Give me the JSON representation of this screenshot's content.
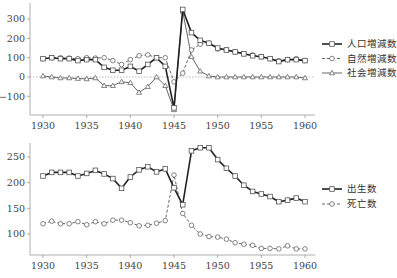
{
  "chart_data": [
    {
      "type": "line",
      "title": "",
      "xlabel": "",
      "ylabel": "",
      "x": [
        1930,
        1931,
        1932,
        1933,
        1934,
        1935,
        1936,
        1937,
        1938,
        1939,
        1940,
        1941,
        1942,
        1943,
        1944,
        1945,
        1946,
        1947,
        1948,
        1949,
        1950,
        1951,
        1952,
        1953,
        1954,
        1955,
        1956,
        1957,
        1958,
        1959,
        1960
      ],
      "xticks": [
        1930,
        1935,
        1940,
        1945,
        1950,
        1955,
        1960
      ],
      "yticks": [
        -100,
        0,
        100,
        200,
        300
      ],
      "ylim": [
        -200,
        400
      ],
      "zero_line": true,
      "grid": false,
      "legend_position": "right",
      "series": [
        {
          "name": "人口増減数",
          "style": "solid-thick",
          "marker": "square",
          "values": [
            95,
            100,
            95,
            95,
            85,
            90,
            90,
            50,
            35,
            35,
            55,
            30,
            65,
            100,
            55,
            -160,
            350,
            230,
            190,
            175,
            150,
            140,
            130,
            120,
            110,
            105,
            95,
            80,
            90,
            90,
            85
          ]
        },
        {
          "name": "自然増減数",
          "style": "dashed",
          "marker": "circle",
          "values": [
            95,
            100,
            100,
            98,
            95,
            100,
            98,
            100,
            85,
            65,
            90,
            110,
            115,
            100,
            100,
            -25,
            20,
            140,
            170,
            175,
            145,
            140,
            130,
            120,
            115,
            105,
            95,
            85,
            90,
            95,
            85
          ]
        },
        {
          "name": "社会増減数",
          "style": "solid-thin",
          "marker": "triangle",
          "values": [
            5,
            0,
            -5,
            -5,
            -8,
            -10,
            -5,
            -45,
            -45,
            -25,
            -30,
            -80,
            -50,
            0,
            -45,
            -170,
            340,
            105,
            30,
            5,
            0,
            0,
            0,
            0,
            0,
            0,
            0,
            0,
            0,
            0,
            -5
          ]
        }
      ]
    },
    {
      "type": "line",
      "title": "",
      "xlabel": "",
      "ylabel": "",
      "x": [
        1930,
        1931,
        1932,
        1933,
        1934,
        1935,
        1936,
        1937,
        1938,
        1939,
        1940,
        1941,
        1942,
        1943,
        1944,
        1945,
        1946,
        1947,
        1948,
        1949,
        1950,
        1951,
        1952,
        1953,
        1954,
        1955,
        1956,
        1957,
        1958,
        1959,
        1960
      ],
      "xticks": [
        1930,
        1935,
        1940,
        1945,
        1950,
        1955,
        1960
      ],
      "yticks": [
        100,
        150,
        200,
        250
      ],
      "ylim": [
        60,
        280
      ],
      "grid": false,
      "legend_position": "right",
      "series": [
        {
          "name": "出生数",
          "style": "solid-thick",
          "marker": "square",
          "values": [
            213,
            220,
            220,
            220,
            213,
            218,
            224,
            217,
            208,
            189,
            211,
            225,
            231,
            221,
            227,
            190,
            157,
            262,
            268,
            268,
            245,
            228,
            213,
            195,
            183,
            178,
            173,
            163,
            166,
            170,
            163
          ]
        },
        {
          "name": "死亡数",
          "style": "dashed",
          "marker": "circle",
          "values": [
            120,
            125,
            120,
            120,
            124,
            118,
            124,
            120,
            127,
            127,
            122,
            116,
            117,
            121,
            126,
            215,
            140,
            117,
            100,
            95,
            94,
            90,
            83,
            80,
            78,
            72,
            72,
            71,
            77,
            71,
            71
          ]
        }
      ]
    }
  ],
  "top_chart": {
    "yticks": [
      "300",
      "200",
      "100",
      "0",
      "−100"
    ],
    "xticks": [
      "1930",
      "1935",
      "1940",
      "1945",
      "1950",
      "1955",
      "1960"
    ],
    "legend": [
      "人口増減数",
      "自然増減数",
      "社会増減数"
    ]
  },
  "bottom_chart": {
    "yticks": [
      "250",
      "200",
      "150",
      "100"
    ],
    "xticks": [
      "1930",
      "1935",
      "1940",
      "1945",
      "1950",
      "1955",
      "1960"
    ],
    "legend": [
      "出生数",
      "死亡数"
    ]
  }
}
